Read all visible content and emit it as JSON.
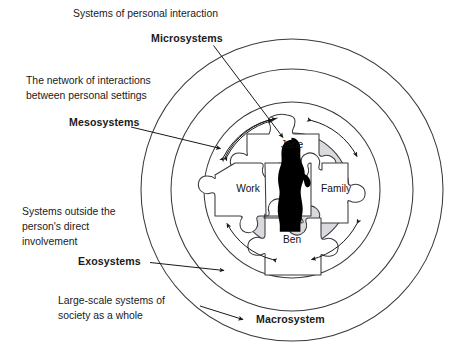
{
  "diagram": {
    "colors": {
      "ring_stroke": "#3a3a40",
      "disc_fill": "#d9d9de",
      "piece_fill": "#ffffff",
      "silhouette": "#000000",
      "text": "#1a1a1a",
      "background": "#ffffff"
    },
    "annotations": [
      {
        "id": "microsystems",
        "description": "Systems of personal interaction",
        "term": "Microsystems",
        "points_to": "jane-puzzle-piece"
      },
      {
        "id": "mesosystems",
        "description_line1": "The network of interactions",
        "description_line2": "between personal settings",
        "term": "Mesosystems",
        "points_to": "inner-ring"
      },
      {
        "id": "exosystems",
        "description_line1": "Systems outside the",
        "description_line2": "person's direct",
        "description_line3": "involvement",
        "term": "Exosystems",
        "points_to": "middle-ring"
      },
      {
        "id": "macrosystem",
        "description_line1": "Large-scale systems of",
        "description_line2": "society as a whole",
        "term": "Macrosystem",
        "points_to": "outer-ring"
      }
    ],
    "puzzle": {
      "pieces": [
        {
          "id": "jane",
          "label": "Jane",
          "position": "top"
        },
        {
          "id": "work",
          "label": "Work",
          "position": "left"
        },
        {
          "id": "family",
          "label": "Family",
          "position": "right"
        },
        {
          "id": "ben",
          "label": "Ben",
          "position": "bottom"
        }
      ],
      "center_figure": "person-silhouette"
    },
    "rings": [
      {
        "id": "outer-ring",
        "name": "macrosystem-ring"
      },
      {
        "id": "middle-ring",
        "name": "exosystem-ring"
      },
      {
        "id": "inner-ring",
        "name": "mesosystem-ring"
      }
    ],
    "interaction_arrows": {
      "count": 4,
      "name": "bidirectional-interaction-arcs"
    }
  }
}
